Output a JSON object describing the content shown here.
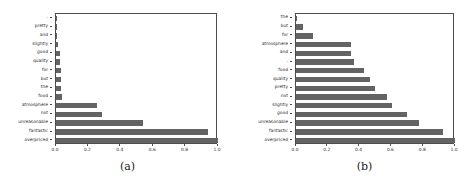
{
  "figure": {
    "panels": [
      {
        "caption": "(a)",
        "name": "panel-a"
      },
      {
        "caption": "(b)",
        "name": "panel-b"
      }
    ]
  },
  "axis": {
    "xticks": [
      "0.0",
      "0.2",
      "0.4",
      "0.6",
      "0.8",
      "1.0"
    ],
    "xtick_values": [
      0.0,
      0.2,
      0.4,
      0.6,
      0.8,
      1.0
    ]
  },
  "colors": {
    "bar": "#636363",
    "frame": "#4d4d4d",
    "text": "#2b2b2b",
    "background": "#ffffff"
  },
  "chart_data": [
    {
      "type": "bar",
      "orientation": "horizontal",
      "title": "",
      "subcaption": "(a)",
      "xlabel": "",
      "ylabel": "",
      "xlim": [
        0.0,
        1.0
      ],
      "grid": false,
      "legend": false,
      "categories": [
        ".",
        "pretty",
        "and",
        "slightly",
        "good",
        "quality",
        "for",
        "but",
        "the",
        "food",
        "atmosphere",
        "not",
        "unreasonable",
        "fantastic",
        "overpriced"
      ],
      "values": [
        0.002,
        0.004,
        0.008,
        0.012,
        0.022,
        0.026,
        0.031,
        0.031,
        0.033,
        0.036,
        0.25,
        0.285,
        0.535,
        0.94,
        1.0
      ]
    },
    {
      "type": "bar",
      "orientation": "horizontal",
      "title": "",
      "subcaption": "(b)",
      "xlabel": "",
      "ylabel": "",
      "xlim": [
        0.0,
        1.0
      ],
      "grid": false,
      "legend": false,
      "categories": [
        "the",
        "but",
        "for",
        "atmosphere",
        "and",
        ".",
        "food",
        "quality",
        "pretty",
        "not",
        "slightly",
        "good",
        "unreasonable",
        "fantastic",
        "overpriced"
      ],
      "values": [
        0.005,
        0.043,
        0.105,
        0.345,
        0.345,
        0.365,
        0.425,
        0.465,
        0.495,
        0.575,
        0.605,
        0.695,
        0.775,
        0.925,
        1.0
      ]
    }
  ]
}
